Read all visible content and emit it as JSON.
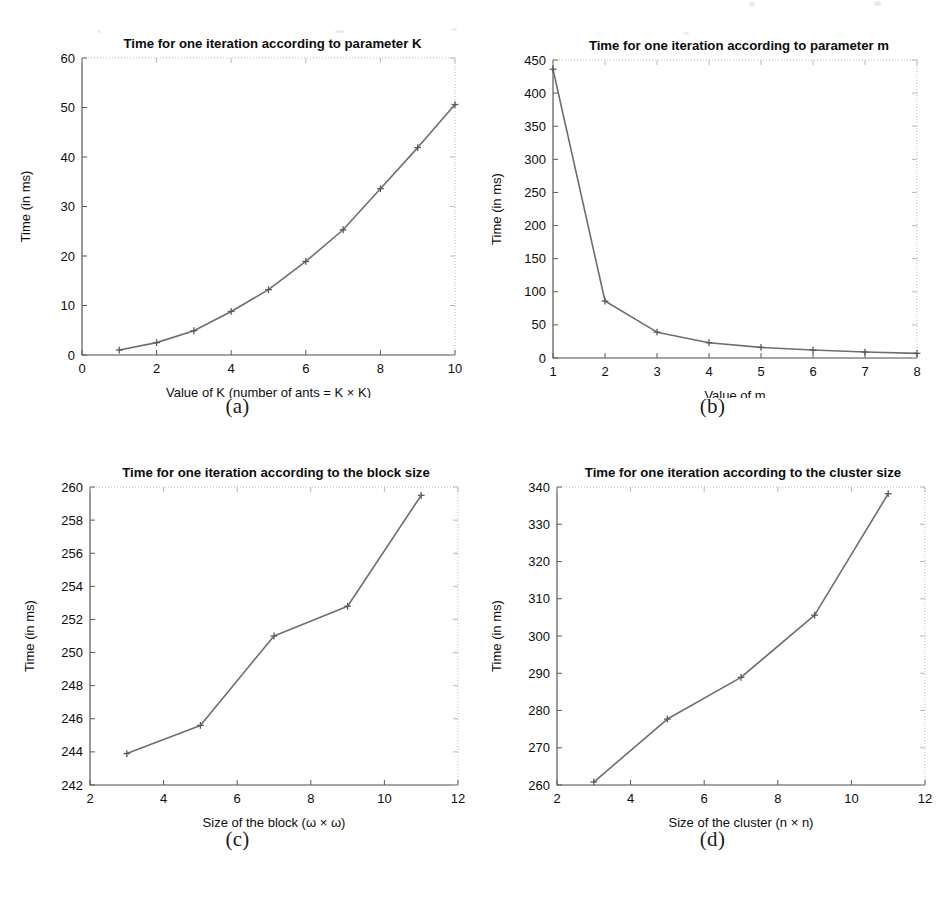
{
  "figure": {
    "background_color": "#ffffff",
    "line_color": "#6e6e6e",
    "axis_color": "#4a4a4a",
    "text_color": "#0d0d0d"
  },
  "panels": [
    {
      "caption": "(a)",
      "title": "Time for one iteration according to parameter K",
      "xlabel": "Value of K (number of ants = K × K)",
      "ylabel": "Time (in ms)",
      "xticks": [
        "0",
        "2",
        "4",
        "6",
        "8",
        "10"
      ],
      "yticks": [
        "0",
        "10",
        "20",
        "30",
        "40",
        "50",
        "60"
      ]
    },
    {
      "caption": "(b)",
      "title": "Time for one iteration according to parameter m",
      "xlabel": "Value of m",
      "ylabel": "Time (in ms)",
      "xticks": [
        "1",
        "2",
        "3",
        "4",
        "5",
        "6",
        "7",
        "8"
      ],
      "yticks": [
        "0",
        "50",
        "100",
        "150",
        "200",
        "250",
        "300",
        "350",
        "400",
        "450"
      ]
    },
    {
      "caption": "(c)",
      "title": "Time for one iteration according to the block size",
      "xlabel": "Size of the block (ω × ω)",
      "ylabel": "Time (in ms)",
      "xticks": [
        "2",
        "4",
        "6",
        "8",
        "10",
        "12"
      ],
      "yticks": [
        "242",
        "244",
        "246",
        "248",
        "250",
        "252",
        "254",
        "256",
        "258",
        "260"
      ]
    },
    {
      "caption": "(d)",
      "title": "Time for one iteration according to the cluster size",
      "xlabel": "Size of the cluster (n × n)",
      "ylabel": "Time (in ms)",
      "xticks": [
        "2",
        "4",
        "6",
        "8",
        "10",
        "12"
      ],
      "yticks": [
        "260",
        "270",
        "280",
        "290",
        "300",
        "310",
        "320",
        "330",
        "340"
      ]
    }
  ],
  "chart_data": [
    {
      "type": "line",
      "title": "Time for one iteration according to parameter K",
      "xlabel": "Value of K (number of ants = K × K)",
      "ylabel": "Time (in ms)",
      "x": [
        1,
        2,
        3,
        4,
        5,
        6,
        7,
        8,
        9,
        10
      ],
      "values": [
        1.0,
        2.5,
        4.9,
        8.8,
        13.2,
        18.9,
        25.3,
        33.6,
        41.9,
        50.6
      ],
      "xlim": [
        0,
        10
      ],
      "ylim": [
        0,
        60
      ],
      "xticks": [
        0,
        2,
        4,
        6,
        8,
        10
      ],
      "yticks": [
        0,
        10,
        20,
        30,
        40,
        50,
        60
      ],
      "grid": false,
      "marker": "plus",
      "legend": null
    },
    {
      "type": "line",
      "title": "Time for one iteration according to parameter m",
      "xlabel": "Value of m",
      "ylabel": "Time (in ms)",
      "x": [
        1,
        2,
        3,
        4,
        5,
        6,
        7,
        8
      ],
      "values": [
        436,
        86,
        39,
        23,
        16,
        12,
        9,
        7
      ],
      "xlim": [
        1,
        8
      ],
      "ylim": [
        0,
        450
      ],
      "xticks": [
        1,
        2,
        3,
        4,
        5,
        6,
        7,
        8
      ],
      "yticks": [
        0,
        50,
        100,
        150,
        200,
        250,
        300,
        350,
        400,
        450
      ],
      "grid": false,
      "marker": "plus",
      "legend": null
    },
    {
      "type": "line",
      "title": "Time for one iteration according to the block size",
      "xlabel": "Size of the block (ω × ω)",
      "ylabel": "Time (in ms)",
      "x": [
        3,
        5,
        7,
        9,
        11
      ],
      "values": [
        243.9,
        245.6,
        251.0,
        252.8,
        259.5
      ],
      "xlim": [
        2,
        12
      ],
      "ylim": [
        242,
        260
      ],
      "xticks": [
        2,
        4,
        6,
        8,
        10,
        12
      ],
      "yticks": [
        242,
        244,
        246,
        248,
        250,
        252,
        254,
        256,
        258,
        260
      ],
      "grid": false,
      "marker": "plus",
      "legend": null
    },
    {
      "type": "line",
      "title": "Time for one iteration according to the cluster size",
      "xlabel": "Size of the cluster (n × n)",
      "ylabel": "Time (in ms)",
      "x": [
        3,
        5,
        7,
        9,
        11
      ],
      "values": [
        260.8,
        277.7,
        288.9,
        305.6,
        338.2
      ],
      "xlim": [
        2,
        12
      ],
      "ylim": [
        260,
        340
      ],
      "xticks": [
        2,
        4,
        6,
        8,
        10,
        12
      ],
      "yticks": [
        260,
        270,
        280,
        290,
        300,
        310,
        320,
        330,
        340
      ],
      "grid": false,
      "marker": "plus",
      "legend": null
    }
  ]
}
